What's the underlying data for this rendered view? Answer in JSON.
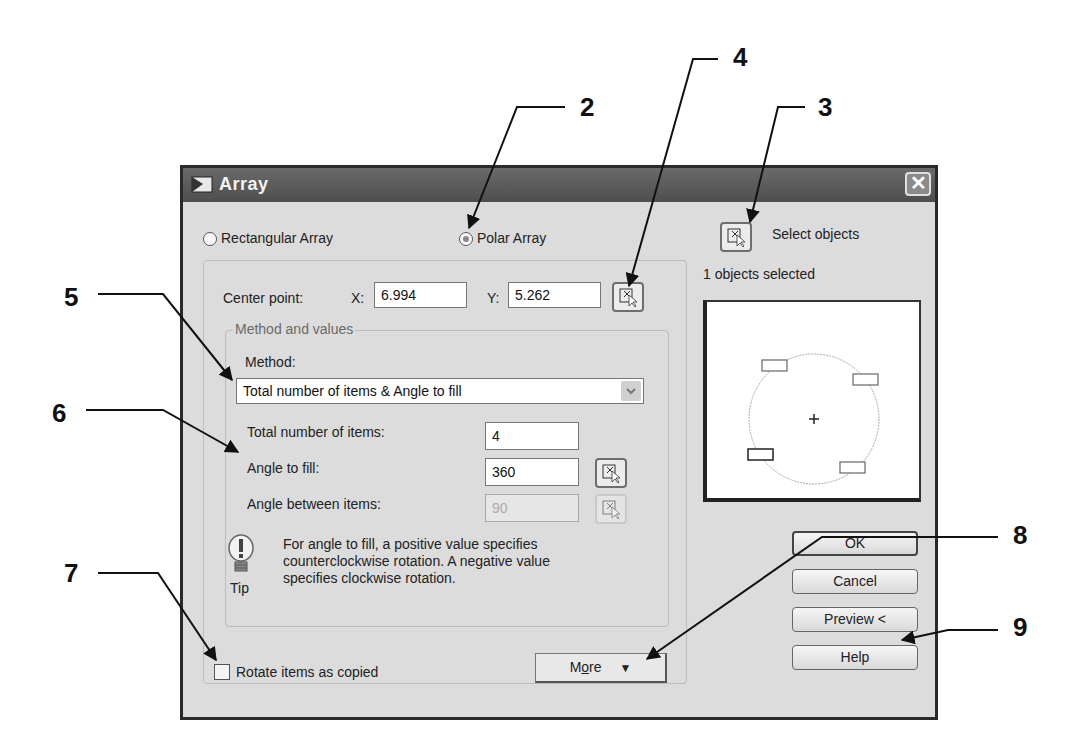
{
  "callouts": [
    {
      "id": "2",
      "label": "2"
    },
    {
      "id": "3",
      "label": "3"
    },
    {
      "id": "4",
      "label": "4"
    },
    {
      "id": "5",
      "label": "5"
    },
    {
      "id": "6",
      "label": "6"
    },
    {
      "id": "7",
      "label": "7"
    },
    {
      "id": "8",
      "label": "8"
    },
    {
      "id": "9",
      "label": "9"
    }
  ],
  "dialog": {
    "title": "Array",
    "close_icon": "close-icon",
    "array_type": {
      "rectangular_label": "Rectangular Array",
      "polar_label": "Polar Array",
      "selected": "Polar Array"
    },
    "select_objects": {
      "label": "Select objects",
      "status": "1 objects selected",
      "icon": "pick-objects-icon"
    },
    "center_point": {
      "label": "Center point:",
      "x_label": "X:",
      "x_value": "6.994",
      "y_label": "Y:",
      "y_value": "5.262",
      "pick_icon": "pick-point-icon"
    },
    "method_group": {
      "legend": "Method and values",
      "method_label": "Method:",
      "method_value": "Total number of items & Angle to fill",
      "total_items_label": "Total number of items:",
      "total_items_value": "4",
      "angle_fill_label": "Angle to fill:",
      "angle_fill_value": "360",
      "angle_between_label": "Angle between items:",
      "angle_between_value": "90"
    },
    "tip": {
      "icon": "lightbulb-icon",
      "caption": "Tip",
      "text_line1": "For angle to fill, a positive value specifies",
      "text_line2": "counterclockwise rotation.  A negative value",
      "text_line3": "specifies clockwise rotation."
    },
    "rotate_items": {
      "label": "Rotate items as copied",
      "checked": false
    },
    "more_button": {
      "label_prefix": "M",
      "label_underlined": "o",
      "label_suffix": "re",
      "icon": "double-chevron-down-icon"
    },
    "buttons": {
      "ok": "OK",
      "cancel": "Cancel",
      "preview": "Preview <",
      "help": "Help"
    }
  }
}
